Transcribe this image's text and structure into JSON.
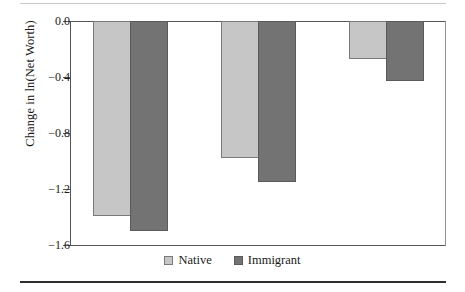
{
  "chart_data": {
    "type": "bar",
    "title": "",
    "subtitle": "",
    "xlabel": "",
    "ylabel": "Change in ln(Net Worth)",
    "categories": [
      "Group 1",
      "Group 2",
      "Group 3"
    ],
    "series": [
      {
        "name": "Native",
        "color": "#c6c6c6",
        "values": [
          -1.39,
          -0.98,
          -0.27
        ]
      },
      {
        "name": "Immigrant",
        "color": "#737373",
        "values": [
          -1.5,
          -1.15,
          -0.43
        ]
      }
    ],
    "ylim": [
      -1.6,
      0.0
    ],
    "yticks": [
      0.0,
      -0.4,
      -0.8,
      -1.2,
      -1.6
    ],
    "ytick_labels": [
      "0.0",
      "−0.4",
      "−0.8",
      "−1.2",
      "−1.6"
    ],
    "xtick_labels": [
      "",
      "",
      ""
    ],
    "grid": false,
    "legend_position": "bottom-center"
  },
  "axis": {
    "y_title": "Change in ln(Net Worth)",
    "ticks": [
      {
        "label": "0.0",
        "value": 0.0
      },
      {
        "label": "−0.4",
        "value": -0.4
      },
      {
        "label": "−0.8",
        "value": -0.8
      },
      {
        "label": "−1.2",
        "value": -1.2
      },
      {
        "label": "−1.6",
        "value": -1.6
      }
    ]
  },
  "legend": {
    "items": [
      {
        "label": "Native",
        "color": "#c6c6c6"
      },
      {
        "label": "Immigrant",
        "color": "#737373"
      }
    ]
  },
  "bars": [
    {
      "group": 0,
      "series": "Native",
      "value": -1.39,
      "left": 93,
      "width": 38
    },
    {
      "group": 0,
      "series": "Immigrant",
      "value": -1.5,
      "left": 130,
      "width": 38
    },
    {
      "group": 1,
      "series": "Native",
      "value": -0.98,
      "left": 221,
      "width": 38
    },
    {
      "group": 1,
      "series": "Immigrant",
      "value": -1.15,
      "left": 258,
      "width": 38
    },
    {
      "group": 2,
      "series": "Native",
      "value": -0.27,
      "left": 349,
      "width": 38
    },
    {
      "group": 2,
      "series": "Immigrant",
      "value": -0.43,
      "left": 386,
      "width": 38
    }
  ]
}
